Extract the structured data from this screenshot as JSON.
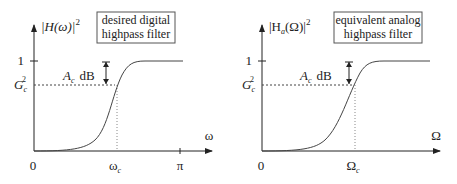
{
  "left_panel": {
    "y_label": "|H(ω)|",
    "y_exp": "2",
    "box_line1": "desired digital",
    "box_line2": "highpass filter",
    "tick_one": "1",
    "tick_g": "G",
    "tick_g_sub": "c",
    "tick_g_sup": "2",
    "atten_a": "A",
    "atten_sub": "c",
    "atten_db": "dB",
    "x_zero": "0",
    "x_cut": "ω",
    "x_cut_sub": "c",
    "x_pi": "π",
    "x_label": "ω"
  },
  "right_panel": {
    "y_label_pre": "|H",
    "y_label_sub": "a",
    "y_label_post": "(Ω)|",
    "y_exp": "2",
    "box_line1": "equivalent analog",
    "box_line2": "highpass filter",
    "tick_one": "1",
    "tick_g": "G",
    "tick_g_sub": "c",
    "tick_g_sup": "2",
    "atten_a": "A",
    "atten_sub": "c",
    "atten_db": "dB",
    "x_zero": "0",
    "x_cut": "Ω",
    "x_cut_sub": "c",
    "x_label": "Ω"
  }
}
